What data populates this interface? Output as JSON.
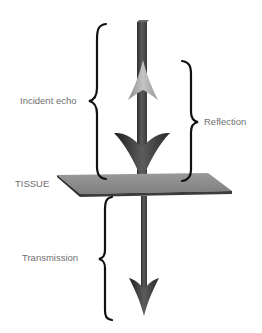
{
  "diagram": {
    "labels": {
      "incident": "Incident echo",
      "reflection": "Reflection",
      "tissue": "TISSUE",
      "transmission": "Transmission"
    },
    "colors": {
      "shaft": "#4a4a4a",
      "down_arrowhead": "#3a3a3a",
      "up_arrowhead": "#a8a8a8",
      "tissue_plane": "#8a8a8a",
      "tissue_edge": "#3c3c3c",
      "brace": "#111111",
      "label_text": "#6f6f6f"
    }
  }
}
